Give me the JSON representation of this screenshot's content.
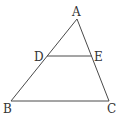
{
  "diagram": {
    "stroke_color": "#4a4a4a",
    "label_color": "#333333",
    "points": {
      "A": {
        "label": "A",
        "x": 77,
        "y": 19
      },
      "B": {
        "label": "B",
        "x": 11,
        "y": 101
      },
      "C": {
        "label": "C",
        "x": 109,
        "y": 101
      },
      "D": {
        "label": "D",
        "x": 47,
        "y": 56
      },
      "E": {
        "label": "E",
        "x": 92,
        "y": 56
      }
    },
    "segments": [
      "AB",
      "AC",
      "BC",
      "DE"
    ],
    "labels": {
      "A": "A",
      "B": "B",
      "C": "C",
      "D": "D",
      "E": "E"
    }
  }
}
